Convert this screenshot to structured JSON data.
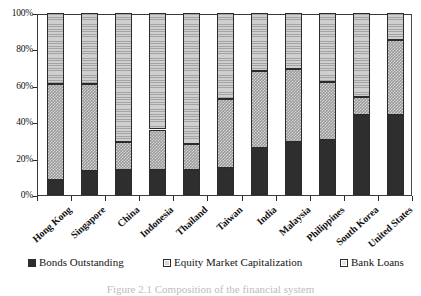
{
  "chart_data": {
    "type": "bar",
    "subtype": "stacked-percentage",
    "title": "",
    "xlabel": "",
    "ylabel": "",
    "ylim": [
      0,
      100
    ],
    "ytick_labels": [
      "100%",
      "80%",
      "60%",
      "40%",
      "20%",
      "0%"
    ],
    "ytick_values": [
      100,
      80,
      60,
      40,
      20,
      0
    ],
    "grid": false,
    "legend_position": "bottom",
    "categories": [
      "Hong Kong",
      "Singapore",
      "China",
      "Indonesia",
      "Thailand",
      "Taiwan",
      "India",
      "Malaysia",
      "Philippines",
      "South Korea",
      "United States"
    ],
    "series": [
      {
        "name": "Bonds Outstanding",
        "color": "#2e2e2e",
        "pattern": "solid",
        "values": [
          8,
          13,
          14,
          14,
          14,
          15,
          26,
          29,
          30,
          44,
          44
        ]
      },
      {
        "name": "Equity Market Capitalization",
        "color": "#9a9a9a",
        "pattern": "checkered",
        "values": [
          53,
          48,
          15,
          22,
          14,
          38,
          42,
          40,
          32,
          10,
          41
        ]
      },
      {
        "name": "Bank Loans",
        "color": "#cfcfcf",
        "pattern": "horizontal-lines",
        "values": [
          39,
          39,
          71,
          64,
          72,
          47,
          32,
          31,
          38,
          46,
          15
        ]
      }
    ],
    "cumulative_tops": {
      "bonds": [
        8,
        13,
        14,
        14,
        14,
        15,
        26,
        29,
        30,
        44,
        44
      ],
      "bonds_plus_equity": [
        61,
        61,
        29,
        36,
        28,
        53,
        68,
        69,
        62,
        54,
        85
      ],
      "total": [
        100,
        100,
        100,
        100,
        100,
        100,
        100,
        100,
        100,
        100,
        100
      ]
    }
  },
  "legend": {
    "items": [
      {
        "label": "Bonds Outstanding",
        "swatch": "bonds"
      },
      {
        "label": "Equity Market Capitalization",
        "swatch": "equity"
      },
      {
        "label": "Bank Loans",
        "swatch": "loans"
      }
    ]
  },
  "caption": "Figure 2.1  Composition of the financial system"
}
